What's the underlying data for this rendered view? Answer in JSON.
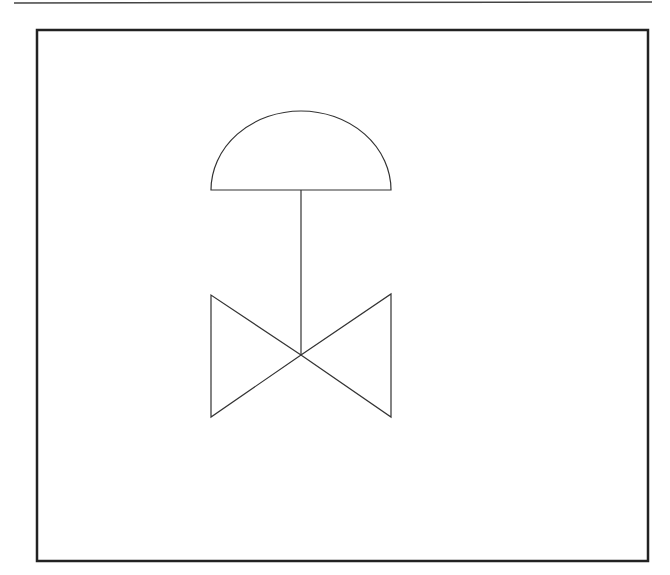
{
  "diagram": {
    "title": "",
    "type": "P&ID symbol",
    "symbol": "diaphragm-actuated control valve",
    "stroke_color": "#333333",
    "frame_color": "#222222",
    "background": "#ffffff",
    "elements": [
      {
        "id": "top-rule",
        "kind": "line",
        "x1": 14,
        "y1": 3,
        "x2": 652,
        "y2": 2
      },
      {
        "id": "frame",
        "kind": "rect",
        "x": 37,
        "y": 30,
        "width": 611,
        "height": 531
      },
      {
        "id": "actuator-dome",
        "kind": "semicircle",
        "cx": 301,
        "cy": 190,
        "r": 90
      },
      {
        "id": "actuator-stem",
        "kind": "line",
        "x1": 301,
        "y1": 190,
        "x2": 301,
        "y2": 355
      },
      {
        "id": "valve-body-left",
        "kind": "triangle",
        "points": "211,295 211,417 301,355"
      },
      {
        "id": "valve-body-right",
        "kind": "triangle",
        "points": "391,294 391,417 301,355"
      }
    ]
  }
}
